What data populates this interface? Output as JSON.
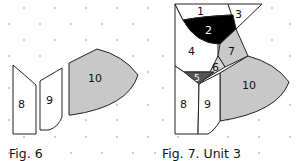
{
  "figures": [
    {
      "id": "fig6",
      "caption": "Fig. 6",
      "pieces": [
        {
          "label": "8",
          "fill": "#ffffff"
        },
        {
          "label": "9",
          "fill": "#ffffff"
        },
        {
          "label": "10",
          "fill": "#c8c8c8"
        }
      ]
    },
    {
      "id": "fig7",
      "caption": "Fig. 7. Unit 3",
      "pieces": [
        {
          "label": "1",
          "fill": "#ffffff"
        },
        {
          "label": "2",
          "fill": "#000000"
        },
        {
          "label": "3",
          "fill": "#ffffff"
        },
        {
          "label": "4",
          "fill": "#ffffff"
        },
        {
          "label": "5",
          "fill": "#555555"
        },
        {
          "label": "6",
          "fill": "#d8d8d8"
        },
        {
          "label": "7",
          "fill": "#c8c8c8"
        },
        {
          "label": "8",
          "fill": "#ffffff"
        },
        {
          "label": "9",
          "fill": "#ffffff"
        },
        {
          "label": "10",
          "fill": "#c8c8c8"
        }
      ]
    }
  ],
  "colors": {
    "grey_piece": "#c8c8c8",
    "light_grey_piece": "#d8d8d8",
    "dark_piece": "#555555",
    "black_piece": "#000000",
    "outline": "#222222",
    "grid_dot": "#bbbbbb"
  }
}
